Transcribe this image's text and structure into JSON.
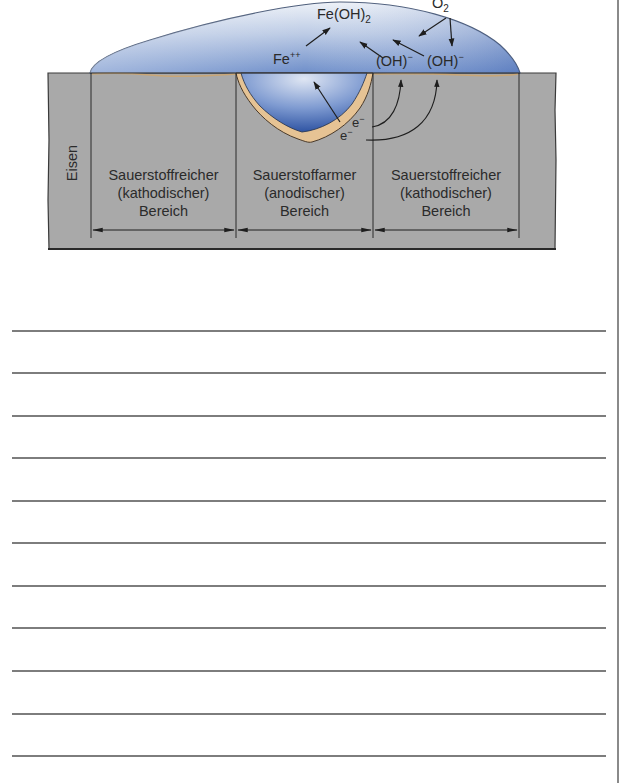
{
  "diagram": {
    "material_label": "Eisen",
    "chemistry": {
      "fe_hydroxide": "Fe(OH)",
      "fe_hydroxide_sub": "2",
      "fe_ion": "Fe",
      "fe_ion_sup": "++",
      "oxygen": "O",
      "oxygen_sub": "2",
      "hydroxide_1": "(OH)",
      "hydroxide_1_sup": "−",
      "hydroxide_2": "(OH)",
      "hydroxide_2_sup": "−",
      "electron_1": "e",
      "electron_1_sup": "−",
      "electron_2": "e",
      "electron_2_sup": "−"
    },
    "regions": [
      {
        "line1": "Sauerstoffreicher",
        "line2": "(kathodischer)",
        "line3": "Bereich"
      },
      {
        "line1": "Sauerstoffarmer",
        "line2": "(anodischer)",
        "line3": "Bereich"
      },
      {
        "line1": "Sauerstoffreicher",
        "line2": "(kathodischer)",
        "line3": "Bereich"
      }
    ],
    "colors": {
      "iron": "#a9a9a9",
      "droplet_light": "#dbe3f0",
      "droplet_dark": "#4a6fb5",
      "rust": "#e6c394",
      "outline": "#333333"
    }
  },
  "answer_lines": {
    "count": 11,
    "y_positions": [
      330,
      372,
      415,
      457,
      500,
      542,
      585,
      627,
      670,
      713,
      755
    ]
  }
}
